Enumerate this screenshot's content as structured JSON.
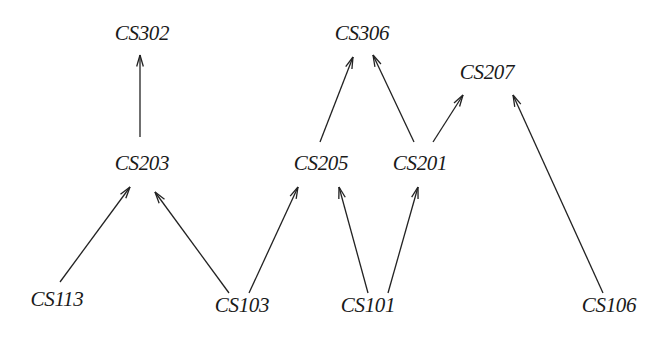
{
  "diagram": {
    "type": "directed-graph",
    "colors": {
      "background": "#ffffff",
      "stroke": "#222222",
      "text": "#1a1a1a"
    },
    "nodes": [
      {
        "id": "CS302",
        "label": "CS302",
        "x": 142,
        "y": 33
      },
      {
        "id": "CS306",
        "label": "CS306",
        "x": 362,
        "y": 33
      },
      {
        "id": "CS207",
        "label": "CS207",
        "x": 487,
        "y": 72
      },
      {
        "id": "CS203",
        "label": "CS203",
        "x": 142,
        "y": 163
      },
      {
        "id": "CS205",
        "label": "CS205",
        "x": 321,
        "y": 163
      },
      {
        "id": "CS201",
        "label": "CS201",
        "x": 420,
        "y": 163
      },
      {
        "id": "CS113",
        "label": "CS113",
        "x": 57,
        "y": 299
      },
      {
        "id": "CS103",
        "label": "CS103",
        "x": 242,
        "y": 305
      },
      {
        "id": "CS101",
        "label": "CS101",
        "x": 368,
        "y": 305
      },
      {
        "id": "CS106",
        "label": "CS106",
        "x": 609,
        "y": 305
      }
    ],
    "edges": [
      {
        "from": "CS203",
        "to": "CS302",
        "x1": 140,
        "y1": 137,
        "x2": 140,
        "y2": 55
      },
      {
        "from": "CS113",
        "to": "CS203",
        "x1": 60,
        "y1": 282,
        "x2": 130,
        "y2": 187
      },
      {
        "from": "CS103",
        "to": "CS203",
        "x1": 229,
        "y1": 293,
        "x2": 155,
        "y2": 192
      },
      {
        "from": "CS103",
        "to": "CS205",
        "x1": 249,
        "y1": 293,
        "x2": 298,
        "y2": 187
      },
      {
        "from": "CS205",
        "to": "CS306",
        "x1": 320,
        "y1": 142,
        "x2": 353,
        "y2": 57
      },
      {
        "from": "CS201",
        "to": "CS306",
        "x1": 414,
        "y1": 142,
        "x2": 373,
        "y2": 55
      },
      {
        "from": "CS201",
        "to": "CS207",
        "x1": 433,
        "y1": 142,
        "x2": 463,
        "y2": 95
      },
      {
        "from": "CS101",
        "to": "CS205",
        "x1": 368,
        "y1": 293,
        "x2": 339,
        "y2": 187
      },
      {
        "from": "CS101",
        "to": "CS201",
        "x1": 388,
        "y1": 293,
        "x2": 418,
        "y2": 187
      },
      {
        "from": "CS106",
        "to": "CS207",
        "x1": 603,
        "y1": 293,
        "x2": 513,
        "y2": 95
      }
    ]
  }
}
